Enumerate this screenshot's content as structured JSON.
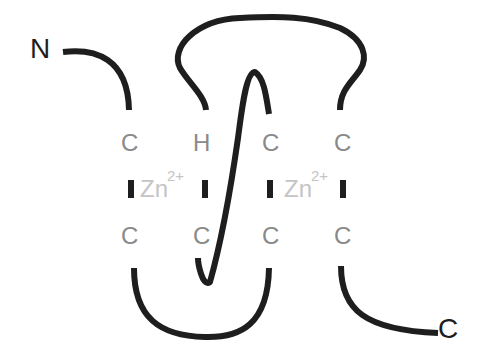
{
  "diagram": {
    "type": "zinc-finger-protein-schematic",
    "termini": {
      "n_label": "N",
      "c_label": "C"
    },
    "top_row_residues": [
      "C",
      "H",
      "C",
      "C"
    ],
    "bottom_row_residues": [
      "C",
      "C",
      "C",
      "C"
    ],
    "zinc_sites": [
      {
        "ion": "Zn",
        "charge": "2+"
      },
      {
        "ion": "Zn",
        "charge": "2+"
      }
    ],
    "colors": {
      "chain": "#1e1e1e",
      "residue_text": "#8a8a8a",
      "ion_text": "#c4c4c4",
      "background": "#ffffff"
    }
  }
}
